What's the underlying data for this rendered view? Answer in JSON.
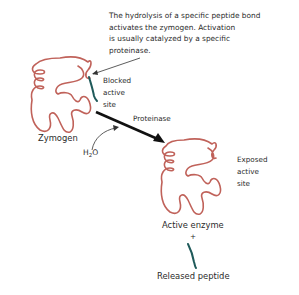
{
  "caption": {
    "lines": [
      "The hydrolysis of a specific peptide bond",
      "activates the zymogen.  Activation",
      "is usually catalyzed by a specific",
      "proteinase."
    ]
  },
  "zymogen": {
    "label": "Zymogen",
    "site_label": [
      "Blocked",
      "active",
      "site"
    ]
  },
  "reaction": {
    "catalyst": "Proteinase",
    "reactant_prefix": "H",
    "reactant_sub": "2",
    "reactant_suffix": "O"
  },
  "active_enzyme": {
    "label": "Active enzyme",
    "site_label": [
      "Exposed",
      "active",
      "site"
    ],
    "plus": "+"
  },
  "peptide": {
    "label": "Released peptide"
  },
  "colors": {
    "protein_chain": "#c0625a",
    "peptide": "#1f5a5a",
    "arrow": "#111111",
    "text": "#2a2a2a"
  }
}
